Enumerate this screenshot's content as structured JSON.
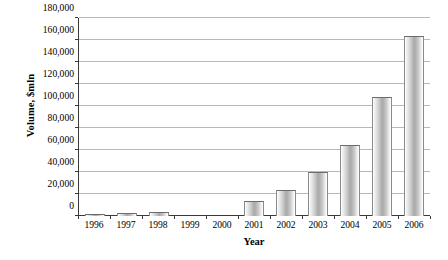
{
  "chart_data": {
    "type": "bar",
    "title": "",
    "xlabel": "Year",
    "ylabel": "Volume, $mln",
    "categories": [
      "1996",
      "1997",
      "1998",
      "1999",
      "2000",
      "2001",
      "2002",
      "2003",
      "2004",
      "2005",
      "2006"
    ],
    "values": [
      1500,
      2500,
      3500,
      0,
      0,
      14000,
      24000,
      40000,
      65000,
      108000,
      164000
    ],
    "yticks": [
      "0",
      "20,000",
      "40,000",
      "60,000",
      "80,000",
      "100,000",
      "120,000",
      "140,000",
      "160,000",
      "180,000"
    ],
    "ytickvalues": [
      0,
      20000,
      40000,
      60000,
      80000,
      100000,
      120000,
      140000,
      160000,
      180000
    ],
    "ylim": [
      0,
      180000
    ],
    "grid": true,
    "legend": false,
    "bar_fill": "#a8a8a8",
    "grid_color": "#b9b9b9",
    "axis_color": "#3a3a3a"
  }
}
